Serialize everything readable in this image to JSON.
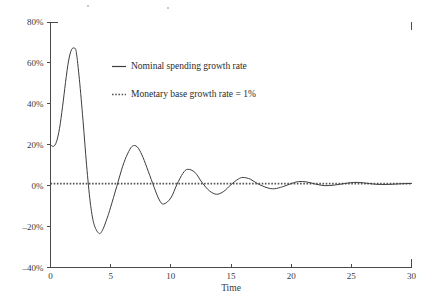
{
  "chart_data": {
    "type": "line",
    "title": "",
    "subtitle": "",
    "xlabel": "Time",
    "ylabel": "",
    "xlim": [
      0,
      30
    ],
    "ylim": [
      -40,
      80
    ],
    "grid": false,
    "legend_position": "upper-center",
    "x_ticks": [
      0,
      5,
      10,
      15,
      20,
      25,
      30
    ],
    "x_tick_labels": [
      "0",
      "5",
      "10",
      "15",
      "20",
      "25",
      "30"
    ],
    "y_ticks": [
      -40,
      -20,
      0,
      20,
      40,
      60,
      80
    ],
    "y_tick_labels": [
      "-40%",
      "-20%",
      "0%",
      "20%",
      "40%",
      "60%",
      "80%"
    ],
    "series": [
      {
        "name": "Nominal spending growth rate",
        "style": "solid",
        "color": "#3d3d3d",
        "model": "damped_oscillation",
        "x": [
          0.0,
          0.25,
          0.5,
          0.75,
          1.0,
          1.25,
          1.5,
          1.75,
          2.0,
          2.15,
          2.4,
          2.7,
          3.0,
          3.3,
          3.6,
          4.0,
          4.3,
          4.7,
          5.0,
          5.5,
          6.0,
          6.4,
          6.8,
          7.2,
          7.6,
          8.0,
          8.5,
          9.0,
          9.4,
          10.0,
          10.5,
          11.0,
          11.4,
          12.0,
          12.6,
          13.2,
          13.8,
          14.4,
          15.0,
          15.6,
          16.0,
          16.6,
          17.2,
          18.0,
          18.6,
          19.3,
          20.0,
          20.6,
          21.3,
          22.0,
          22.8,
          23.6,
          24.4,
          25.2,
          26.0,
          27.0,
          28.0,
          29.0,
          30.0
        ],
        "y": [
          20.0,
          19.2,
          21.5,
          28.0,
          38.5,
          50.5,
          61.0,
          66.5,
          67.2,
          65.0,
          52.0,
          32.0,
          10.0,
          -8.0,
          -18.5,
          -23.2,
          -22.0,
          -16.0,
          -10.5,
          -0.5,
          9.5,
          15.5,
          19.3,
          19.0,
          15.0,
          9.0,
          1.0,
          -6.5,
          -9.0,
          -6.0,
          0.5,
          6.0,
          8.0,
          6.5,
          1.5,
          -2.5,
          -4.2,
          -2.8,
          0.5,
          3.2,
          4.0,
          3.2,
          1.0,
          -1.0,
          -1.5,
          -0.5,
          1.0,
          2.0,
          1.8,
          0.8,
          0.0,
          0.3,
          1.0,
          1.6,
          1.4,
          0.7,
          0.6,
          0.9,
          1.1
        ],
        "key_points": {
          "start_value": 20.0,
          "peak_1": {
            "x": 2.1,
            "y": 67.0
          },
          "trough_1": {
            "x": 4.0,
            "y": -23.2
          },
          "peak_2": {
            "x": 6.8,
            "y": 19.3
          },
          "trough_2": {
            "x": 9.3,
            "y": -9.2
          },
          "peak_3": {
            "x": 11.3,
            "y": 8.0
          },
          "trough_3": {
            "x": 13.8,
            "y": -4.2
          },
          "peak_4": {
            "x": 15.9,
            "y": 4.0
          },
          "trough_4": {
            "x": 18.5,
            "y": -1.6
          },
          "peak_5": {
            "x": 20.6,
            "y": 2.0
          },
          "converges_to": 1.0
        }
      },
      {
        "name": "Monetary base growth rate = 1%",
        "style": "dotted",
        "color": "#555555",
        "constant_value": 1.0
      }
    ],
    "legend": [
      {
        "label": "Nominal spending growth rate",
        "style": "solid"
      },
      {
        "label": "Monetary base growth rate = 1%",
        "style": "dotted"
      }
    ]
  },
  "colors": {
    "background": "#ffffff",
    "axis": "#4a4a4a",
    "series_solid": "#3d3d3d",
    "series_dotted": "#555555",
    "text": "#2b2b2b"
  }
}
